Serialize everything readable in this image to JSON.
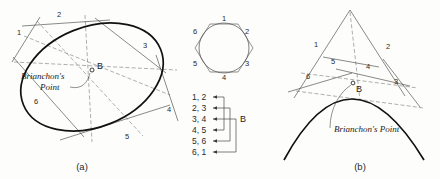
{
  "figure": {
    "background_color": "#fdfdfb",
    "ink_color": "#111111"
  },
  "panel_a": {
    "caption": "(a)",
    "conic_type": "ellipse",
    "point_label": "B",
    "annotation_line1": "Brianchon's",
    "annotation_line2": "Point",
    "tangent_labels": [
      "1",
      "2",
      "3",
      "4",
      "5",
      "6"
    ]
  },
  "panel_middle": {
    "hexagon_side_labels": [
      "1",
      "2",
      "3",
      "4",
      "5",
      "6"
    ],
    "pairing_label": "B",
    "pairings": [
      "1, 2",
      "2, 3",
      "3, 4",
      "4, 5",
      "5, 6",
      "6, 1"
    ]
  },
  "panel_b": {
    "caption": "(b)",
    "conic_type": "parabola",
    "point_label": "B",
    "annotation": "Brianchon's Point",
    "tangent_labels": [
      "1",
      "2",
      "3",
      "4",
      "5",
      "6"
    ]
  }
}
